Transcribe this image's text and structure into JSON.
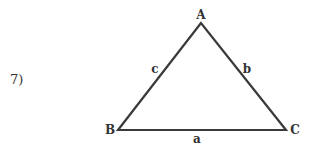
{
  "problem": {
    "number": "7)"
  },
  "triangle": {
    "vertices": [
      {
        "name": "A",
        "x": 201,
        "y": 23
      },
      {
        "name": "B",
        "x": 118,
        "y": 130
      },
      {
        "name": "C",
        "x": 286,
        "y": 130
      }
    ],
    "sides": [
      {
        "name": "a",
        "between": "B-C"
      },
      {
        "name": "b",
        "between": "A-C"
      },
      {
        "name": "c",
        "between": "A-B"
      }
    ],
    "labels": {
      "A": "A",
      "B": "B",
      "C": "C",
      "a": "a",
      "b": "b",
      "c": "c"
    },
    "stroke_color": "#3a3a3a"
  }
}
